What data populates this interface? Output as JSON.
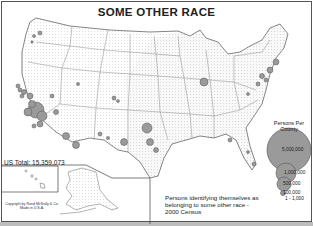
{
  "map": {
    "title": "SOME OTHER RACE",
    "us_total_label": "US Total:",
    "us_total_value": "15,359,073",
    "caption": "Persons identifying themselves as belonging to some other race - 2000 Census",
    "copyright_line1": "Copyright by Rand McNally & Co.",
    "copyright_line2": "Made in U.S.A.",
    "colors": {
      "circle_fill": "#9a9a9a",
      "circle_stroke": "#555555",
      "border": "#555555",
      "state_lines": "#888888"
    }
  },
  "legend": {
    "title": "Persons Per County",
    "items": [
      {
        "label": "5,000,000",
        "radius": 22
      },
      {
        "label": "1,000,000",
        "radius": 10
      },
      {
        "label": "500,000",
        "radius": 7
      },
      {
        "label": "100,000",
        "radius": 3
      },
      {
        "label": "1 - 1,000",
        "radius": 0.6
      }
    ]
  }
}
